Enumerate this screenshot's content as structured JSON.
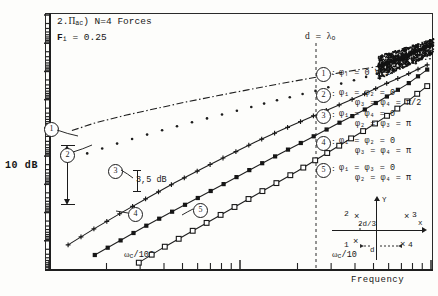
{
  "figure": {
    "title_line1_prefix": "2.",
    "title_line1_symbol": "Π",
    "title_line1_sub": "ac",
    "title_line1_rest": ") N=4 Forces",
    "title_line1_full": "2.Πac ) N=4 Forces",
    "title_line2": "Fᵢ = 0.25",
    "title_line2_var": "F",
    "title_line2_sub": "i",
    "title_line2_val": "= 0.25"
  },
  "axes": {
    "y_scale_label": "10 dB",
    "y_axis_type": "log-dB",
    "x_axis_label": "Frequency",
    "x_ticks": [
      {
        "label": "ωc/100",
        "base": "ω",
        "sub": "c",
        "rest": "/100",
        "x_frac": 0.335
      },
      {
        "label": "ωc/10",
        "base": "ω",
        "sub": "c",
        "rest": "/10",
        "x_frac": 0.875
      }
    ]
  },
  "annotations": {
    "d_lambda": {
      "var": "d",
      "eq": "=",
      "val": "λ",
      "sub": "o",
      "full": "d = λₒ"
    },
    "delta_db": {
      "value": "3,5",
      "unit": "dB",
      "full": "3,5 dB"
    }
  },
  "legend": {
    "entries": [
      {
        "id": "1",
        "sep": ":",
        "line1": "φᵢ = 0 ∀ i",
        "line2": ""
      },
      {
        "id": "2",
        "sep": ":",
        "line1": "φ₁ = φ₂ = 0",
        "line2": "φ₃ = φ₄ = π/2"
      },
      {
        "id": "3",
        "sep": ":",
        "line1": "φ₁ = φ₄ = 0",
        "line2": "φ₂ = φ₃ = π"
      },
      {
        "id": "4",
        "sep": ":",
        "line1": "φ₁ = φ₂ = 0",
        "line2": "φ₃ = φ₄ = π"
      },
      {
        "id": "5",
        "sep": ":",
        "line1": "φ₁ = φ₃ = 0",
        "line2": "φ₂ = φ₄ = π"
      }
    ]
  },
  "inset": {
    "x_axis": "x",
    "y_axis": "Y",
    "spacing_label": "2d/3",
    "d_label": "d",
    "points": [
      {
        "id": "1",
        "label": "1"
      },
      {
        "id": "2",
        "label": "2"
      },
      {
        "id": "3",
        "label": "3"
      },
      {
        "id": "4",
        "label": "4"
      }
    ]
  },
  "callouts": [
    {
      "id": "1"
    },
    {
      "id": "2"
    },
    {
      "id": "3"
    },
    {
      "id": "4"
    },
    {
      "id": "5"
    }
  ],
  "chart_data": {
    "type": "line",
    "xlabel": "Frequency",
    "ylabel": "10 dB",
    "xscale": "log",
    "yscale": "dB",
    "grid": false,
    "legend_position": "right",
    "xlim_labels": [
      "ωc/100",
      "ωc/10"
    ],
    "annotations": [
      "d = λₒ",
      "3,5 dB",
      "10 dB"
    ],
    "series": [
      {
        "name": "1",
        "phase": "φᵢ = 0 ∀ i",
        "marker": "dashdot-line",
        "x": [
          0.06,
          0.12,
          0.2,
          0.28,
          0.36,
          0.44,
          0.52,
          0.6,
          0.68,
          0.76,
          0.84,
          0.9,
          0.95,
          1.0
        ],
        "y": [
          0.455,
          0.425,
          0.395,
          0.368,
          0.342,
          0.318,
          0.295,
          0.272,
          0.25,
          0.228,
          0.208,
          0.192,
          0.18,
          0.172
        ]
      },
      {
        "name": "2",
        "phase": "φ₁ = φ₂ = 0 ; φ₃ = φ₄ = π/2",
        "marker": "dot",
        "x": [
          0.1,
          0.17,
          0.24,
          0.31,
          0.38,
          0.45,
          0.52,
          0.58,
          0.64,
          0.7,
          0.76,
          0.82,
          0.87,
          0.92,
          0.96
        ],
        "y": [
          0.545,
          0.51,
          0.478,
          0.448,
          0.42,
          0.393,
          0.366,
          0.342,
          0.32,
          0.298,
          0.272,
          0.248,
          0.226,
          0.205,
          0.19
        ]
      },
      {
        "name": "3",
        "phase": "φ₁ = φ₄ = 0 ; φ₂ = φ₃ = π",
        "marker": "plus",
        "x": [
          0.05,
          0.12,
          0.19,
          0.26,
          0.33,
          0.4,
          0.47,
          0.54,
          0.61,
          0.68,
          0.75,
          0.82,
          0.88,
          0.94,
          0.99
        ],
        "y": [
          0.905,
          0.84,
          0.778,
          0.718,
          0.66,
          0.605,
          0.552,
          0.5,
          0.452,
          0.405,
          0.36,
          0.315,
          0.272,
          0.232,
          0.196
        ]
      },
      {
        "name": "4",
        "phase": "φ₁ = φ₂ = 0 ; φ₃ = φ₄ = π",
        "marker": "filled-square",
        "x": [
          0.12,
          0.19,
          0.26,
          0.33,
          0.4,
          0.47,
          0.54,
          0.61,
          0.68,
          0.75,
          0.82,
          0.88,
          0.94,
          0.99
        ],
        "y": [
          0.945,
          0.885,
          0.825,
          0.768,
          0.712,
          0.655,
          0.598,
          0.542,
          0.488,
          0.432,
          0.378,
          0.325,
          0.27,
          0.215
        ]
      },
      {
        "name": "5",
        "phase": "φ₁ = φ₃ = 0 ; φ₂ = φ₄ = π",
        "marker": "open-square",
        "x": [
          0.235,
          0.3,
          0.37,
          0.44,
          0.51,
          0.58,
          0.65,
          0.71,
          0.77,
          0.83,
          0.89,
          0.94,
          0.99
        ],
        "y": [
          0.975,
          0.915,
          0.855,
          0.795,
          0.735,
          0.675,
          0.615,
          0.56,
          0.505,
          0.45,
          0.392,
          0.338,
          0.28
        ]
      },
      {
        "name": "envelope",
        "phase": "asymptotic convergence band near d = λₒ",
        "marker": "dense-noise",
        "x": [
          0.98,
          1.0
        ],
        "y": [
          0.17,
          0.13
        ]
      }
    ]
  }
}
